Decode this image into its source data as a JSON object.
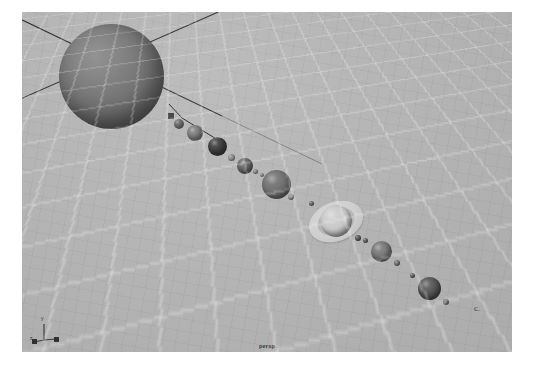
{
  "app": {
    "viewport_label": "persp",
    "background_color": "#b4b5b4",
    "page_background": "#ffffff"
  },
  "axis_gizmo": {
    "name": "axis-triad",
    "y_label": "y",
    "z_label": "z",
    "x_label": "x",
    "color": "#3b3b3b"
  },
  "scene": {
    "name": "solar-system",
    "grid": {
      "visible": true,
      "line_color": "#ffffff",
      "dark_line_color": "#1c1c1c"
    },
    "axis_lines": {
      "visible": true,
      "color": "#2b2b2b"
    },
    "bodies": [
      {
        "id": "sun",
        "label": "sun",
        "kind": "star",
        "x": 37,
        "y": 12,
        "size": 105,
        "color": "#6b6b6b"
      },
      {
        "id": "mercury",
        "label": "mercury",
        "kind": "planet",
        "x": 152,
        "y": 107,
        "size": 10,
        "color": "#6f6f6f"
      },
      {
        "id": "venus",
        "label": "venus",
        "kind": "planet",
        "x": 165,
        "y": 113,
        "size": 16,
        "color": "#757575"
      },
      {
        "id": "earth",
        "label": "earth",
        "kind": "planet",
        "x": 186,
        "y": 125,
        "size": 19,
        "color": "#2e2e2e"
      },
      {
        "id": "earth-moon",
        "label": "moon",
        "kind": "moon",
        "x": 206,
        "y": 142,
        "size": 7,
        "color": "#8a8a8a"
      },
      {
        "id": "mars",
        "label": "mars",
        "kind": "planet",
        "x": 215,
        "y": 146,
        "size": 16,
        "color": "#5e5e5e"
      },
      {
        "id": "mars-moon-1",
        "label": "phobos",
        "kind": "moon",
        "x": 231,
        "y": 157,
        "size": 5,
        "color": "#8b8b8b"
      },
      {
        "id": "mars-moon-2",
        "label": "deimos",
        "kind": "moon",
        "x": 238,
        "y": 161,
        "size": 4,
        "color": "#909090"
      },
      {
        "id": "jupiter",
        "label": "jupiter",
        "kind": "planet",
        "x": 240,
        "y": 158,
        "size": 29,
        "color": "#6a6a6a"
      },
      {
        "id": "jupiter-moon",
        "label": "io",
        "kind": "moon",
        "x": 266,
        "y": 182,
        "size": 6,
        "color": "#8e8e8e"
      },
      {
        "id": "saturn",
        "label": "saturn",
        "kind": "planet-ringed",
        "x": 298,
        "y": 193,
        "size": 32,
        "ring_outer": 56,
        "ring_inner": 38,
        "color": "#c9c9c9"
      },
      {
        "id": "saturn-moon-1",
        "label": "titan",
        "kind": "moon",
        "x": 287,
        "y": 189,
        "size": 5,
        "color": "#6f6f6f"
      },
      {
        "id": "saturn-moon-2",
        "label": "rhea",
        "kind": "moon",
        "x": 333,
        "y": 223,
        "size": 6,
        "color": "#5d5d5d"
      },
      {
        "id": "uranus",
        "label": "uranus",
        "kind": "planet",
        "x": 349,
        "y": 229,
        "size": 21,
        "color": "#7a7a7a"
      },
      {
        "id": "uranus-moon-1",
        "label": "titania",
        "kind": "moon",
        "x": 341,
        "y": 226,
        "size": 5,
        "color": "#6a6a6a"
      },
      {
        "id": "uranus-moon-2",
        "label": "oberon",
        "kind": "moon",
        "x": 372,
        "y": 248,
        "size": 6,
        "color": "#787878"
      },
      {
        "id": "neptune",
        "label": "neptune",
        "kind": "planet",
        "x": 396,
        "y": 265,
        "size": 23,
        "color": "#585858"
      },
      {
        "id": "neptune-moon-1",
        "label": "triton",
        "kind": "moon",
        "x": 388,
        "y": 261,
        "size": 5,
        "color": "#6b6b6b"
      },
      {
        "id": "neptune-moon-2",
        "label": "nereid",
        "kind": "moon",
        "x": 421,
        "y": 287,
        "size": 6,
        "color": "#6f6f6f"
      }
    ],
    "far_body": {
      "id": "pluto",
      "label": "pluto",
      "glyph": "c",
      "dot_glyph": ".",
      "x": 452,
      "y": 292
    },
    "pivot_handle": {
      "id": "pivot",
      "label": "pivot-handle",
      "x": 146,
      "y": 101,
      "size": 6,
      "color": "#3a3a3a"
    }
  }
}
